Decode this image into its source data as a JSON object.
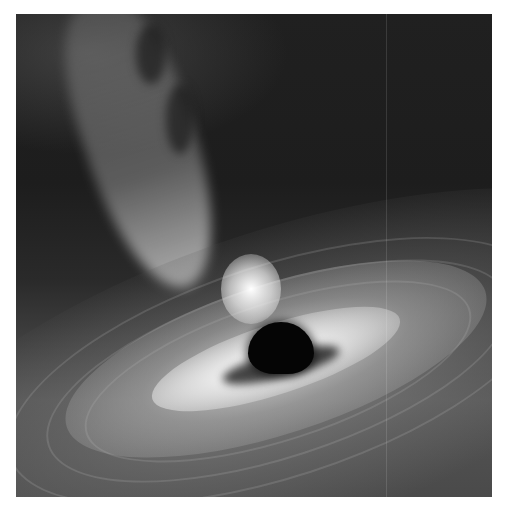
{
  "image": {
    "subject": "black hole with accretion disk and relativistic jet",
    "style": "grayscale illustration",
    "colors": {
      "background_page": "#ffffff",
      "space": "#1c1c1c",
      "disk_highlight": "#f0f0f0",
      "event_horizon": "#050505"
    }
  }
}
